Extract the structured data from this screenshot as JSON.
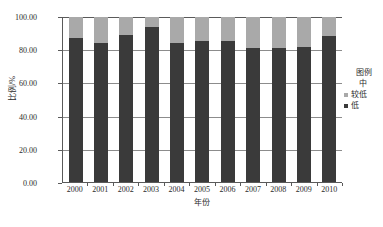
{
  "chart_data": {
    "type": "bar",
    "subtype": "stacked-bar",
    "title": "",
    "xlabel": "年份",
    "ylabel": "比例/%",
    "ylim": [
      0,
      100
    ],
    "yticks": [
      "0.00",
      "20.00",
      "40.00",
      "60.00",
      "80.00",
      "100.00"
    ],
    "ytick_values": [
      0,
      20,
      40,
      60,
      80,
      100
    ],
    "grid": true,
    "legend_position": "right",
    "legend_title": "图例",
    "categories": [
      "2000",
      "2001",
      "2002",
      "2003",
      "2004",
      "2005",
      "2006",
      "2007",
      "2008",
      "2009",
      "2010"
    ],
    "series": [
      {
        "name": "低",
        "color": "#3a3a3a",
        "values": [
          87.0,
          84.5,
          89.0,
          94.0,
          84.5,
          85.5,
          85.5,
          81.0,
          81.0,
          82.0,
          88.5
        ]
      },
      {
        "name": "较低",
        "color": "#a9a9a9",
        "values": [
          13.0,
          15.5,
          11.0,
          6.0,
          15.5,
          14.5,
          14.5,
          19.0,
          19.0,
          18.0,
          11.5
        ]
      },
      {
        "name": "中",
        "color": "#ffffff",
        "values": [
          0,
          0,
          0,
          0,
          0,
          0,
          0,
          0,
          0,
          0,
          0
        ]
      }
    ]
  },
  "legend": {
    "title": "图例",
    "items": [
      {
        "label": "中",
        "color": "#ffffff",
        "swatch": "blank"
      },
      {
        "label": "较低",
        "color": "#a9a9a9",
        "swatch": "filled"
      },
      {
        "label": "低",
        "color": "#3a3a3a",
        "swatch": "filled"
      }
    ]
  },
  "colors": {
    "low": "#3a3a3a",
    "lower_middle": "#a9a9a9",
    "middle": "#ffffff",
    "axis": "#5a5a5a",
    "grid": "#8c8c8c",
    "text": "#2b2b2b",
    "background": "#ffffff"
  }
}
